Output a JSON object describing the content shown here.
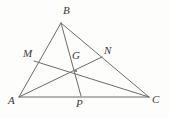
{
  "figure": {
    "background_color": "#fdfdfc",
    "stroke_color": "#6b6b6b",
    "label_color": "#3a3a3a",
    "stroke_width": 1,
    "width": 169,
    "height": 118
  },
  "points": {
    "A": {
      "label": "A",
      "x": 19,
      "y": 97,
      "label_x": 8,
      "label_y": 95
    },
    "B": {
      "label": "B",
      "x": 61,
      "y": 23,
      "label_x": 63,
      "label_y": 5
    },
    "C": {
      "label": "C",
      "x": 149,
      "y": 97,
      "label_x": 152,
      "label_y": 94
    },
    "M": {
      "label": "M",
      "x": 34,
      "y": 61,
      "label_x": 23,
      "label_y": 48
    },
    "N": {
      "label": "N",
      "x": 102,
      "y": 57,
      "label_x": 104,
      "label_y": 45
    },
    "G": {
      "label": "G",
      "x": 76,
      "y": 71,
      "label_x": 72,
      "label_y": 50
    },
    "P": {
      "label": "P",
      "x": 81,
      "y": 96,
      "label_x": 76,
      "label_y": 98
    }
  },
  "segments": [
    {
      "name": "side-AB",
      "from": "A",
      "to": "B"
    },
    {
      "name": "side-BC",
      "from": "B",
      "to": "C"
    },
    {
      "name": "side-AC",
      "from": "A",
      "to": "C"
    },
    {
      "name": "cevian-AN",
      "from": "A",
      "to": "N"
    },
    {
      "name": "cevian-BP",
      "from": "B",
      "to": "P"
    },
    {
      "name": "cevian-CM",
      "from": "C",
      "to": "M"
    }
  ]
}
